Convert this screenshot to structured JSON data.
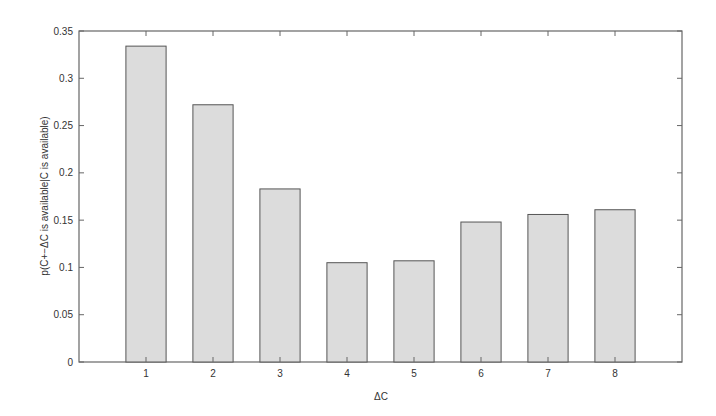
{
  "chart_data": {
    "type": "bar",
    "title": "",
    "xlabel": "ΔC",
    "ylabel": "p(C+−ΔC is available|C is available)",
    "categories": [
      "1",
      "2",
      "3",
      "4",
      "5",
      "6",
      "7",
      "8"
    ],
    "values": [
      0.334,
      0.272,
      0.183,
      0.105,
      0.107,
      0.148,
      0.156,
      0.161
    ],
    "ylim": [
      0,
      0.35
    ],
    "xlim": [
      0,
      9
    ],
    "yticks": [
      "0",
      "0.05",
      "0.1",
      "0.15",
      "0.2",
      "0.25",
      "0.3",
      "0.35"
    ],
    "grid": false,
    "legend": null,
    "colors": {
      "bar_fill": "#dcdcdc",
      "bar_edge": "#555555",
      "axis": "#666666"
    }
  }
}
